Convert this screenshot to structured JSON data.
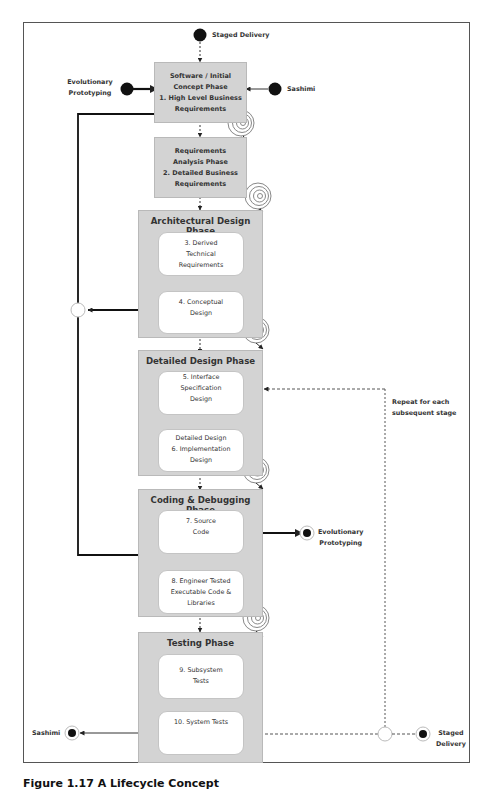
{
  "diagram": {
    "caption": "Figure 1.17 A Lifecycle Concept",
    "entry_points": {
      "staged_delivery_top": "Staged Delivery",
      "evolutionary_prototyping_left": [
        "Evolutionary",
        "Prototyping"
      ],
      "sashimi_right": "Sashimi",
      "evolutionary_prototyping_exit": [
        "Evolutionary",
        "Prototyping"
      ],
      "sashimi_exit": "Sashimi",
      "staged_delivery_bottom": [
        "Staged",
        "Delivery"
      ]
    },
    "repeat_note": [
      "Repeat for each",
      "subsequent stage"
    ],
    "phases": [
      {
        "title": "",
        "lines": [
          "Software / Initial",
          "Concept Phase",
          "1. High Level Business",
          "Requirements"
        ]
      },
      {
        "title": "",
        "lines": [
          "Requirements",
          "Analysis Phase",
          "2. Detailed Business",
          "Requirements"
        ]
      },
      {
        "title": "Architectural Design Phase",
        "steps": [
          {
            "lines": [
              "3. Derived",
              "Technical",
              "Requirements"
            ]
          },
          {
            "lines": [
              "4. Conceptual",
              "Design"
            ]
          }
        ]
      },
      {
        "title": "Detailed Design Phase",
        "steps": [
          {
            "lines": [
              "5. Interface",
              "Specification",
              "Design"
            ]
          },
          {
            "lines": [
              "Detailed Design",
              "6. Implementation",
              "Design"
            ]
          }
        ]
      },
      {
        "title": "Coding & Debugging  Phase",
        "steps": [
          {
            "lines": [
              "7. Source",
              "Code"
            ]
          },
          {
            "lines": [
              "8. Engineer Tested",
              "Executable Code &",
              "Libraries"
            ]
          }
        ]
      },
      {
        "title": "Testing Phase",
        "steps": [
          {
            "lines": [
              "9. Subsystem",
              "Tests"
            ]
          },
          {
            "lines": [
              "10. System Tests"
            ]
          }
        ]
      }
    ],
    "colors": {
      "phase_fill": "#d3d3d3",
      "step_fill": "#ffffff",
      "line": "#222222"
    }
  }
}
